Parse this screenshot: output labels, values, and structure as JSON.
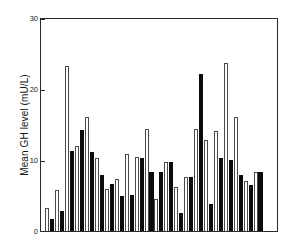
{
  "chart_data": {
    "type": "bar",
    "title": "",
    "xlabel": "",
    "ylabel": "Mean GH level (mU/L)",
    "ylim": [
      0,
      30
    ],
    "yticks": [
      0,
      10,
      20,
      30
    ],
    "ytick_labels": [
      "0",
      "10",
      "20",
      "30"
    ],
    "grid": false,
    "legend": "none",
    "xaxis_ticks_visible": false,
    "xtick_labels": [],
    "categories": [
      "1",
      "2",
      "3",
      "4",
      "5",
      "6",
      "7",
      "8",
      "9",
      "10",
      "11",
      "12",
      "13",
      "14",
      "15",
      "16",
      "17",
      "18",
      "19",
      "20",
      "21",
      "22",
      "23",
      "24",
      "25",
      "26"
    ],
    "series": [
      {
        "name": "open",
        "style": "white-filled-outlined",
        "color": "#ffffff",
        "edge_color": "#4a4a4a",
        "values": [
          3.3,
          5.8,
          23.3,
          12.0,
          16.2,
          10.4,
          6.0,
          7.4,
          10.9,
          10.5,
          14.1,
          4.6,
          8.3,
          9.8,
          6.2,
          7.7,
          14.4,
          12.9,
          14.1,
          23.8,
          16.1,
          7.1,
          8.3,
          0,
          0,
          0
        ]
      },
      {
        "name": "filled",
        "style": "black-filled",
        "color": "#0b0b0b",
        "edge_color": "#0b0b0b",
        "values": [
          1.7,
          2.9,
          11.3,
          14.3,
          11.2,
          7.9,
          6.6,
          4.9,
          5.1,
          10.4,
          8.4,
          8.3,
          9.8,
          2.5,
          7.6,
          22.2,
          3.8,
          10.4,
          10.0,
          7.9,
          6.5,
          8.3,
          0,
          0,
          0,
          0
        ]
      }
    ],
    "bars_in_draw_order": [
      {
        "fill": "white",
        "value": 3.3
      },
      {
        "fill": "black",
        "value": 1.7
      },
      {
        "fill": "white",
        "value": 5.8
      },
      {
        "fill": "black",
        "value": 2.9
      },
      {
        "fill": "white",
        "value": 23.3
      },
      {
        "fill": "black",
        "value": 11.3
      },
      {
        "fill": "white",
        "value": 12.0
      },
      {
        "fill": "black",
        "value": 14.3
      },
      {
        "fill": "white",
        "value": 16.2
      },
      {
        "fill": "black",
        "value": 11.2
      },
      {
        "fill": "white",
        "value": 10.4
      },
      {
        "fill": "black",
        "value": 7.9
      },
      {
        "fill": "white",
        "value": 6.0
      },
      {
        "fill": "black",
        "value": 6.6
      },
      {
        "fill": "white",
        "value": 7.4
      },
      {
        "fill": "black",
        "value": 4.9
      },
      {
        "fill": "white",
        "value": 10.9
      },
      {
        "fill": "black",
        "value": 5.1
      },
      {
        "fill": "white",
        "value": 10.5
      },
      {
        "fill": "black",
        "value": 10.4
      },
      {
        "fill": "white",
        "value": 14.4
      },
      {
        "fill": "black",
        "value": 8.4
      },
      {
        "fill": "white",
        "value": 4.6
      },
      {
        "fill": "black",
        "value": 8.3
      },
      {
        "fill": "white",
        "value": 9.8
      },
      {
        "fill": "black",
        "value": 9.8
      },
      {
        "fill": "white",
        "value": 6.2
      },
      {
        "fill": "black",
        "value": 2.5
      },
      {
        "fill": "white",
        "value": 7.7
      },
      {
        "fill": "black",
        "value": 7.6
      },
      {
        "fill": "white",
        "value": 14.4
      },
      {
        "fill": "black",
        "value": 22.2
      },
      {
        "fill": "white",
        "value": 12.9
      },
      {
        "fill": "black",
        "value": 3.8
      },
      {
        "fill": "white",
        "value": 14.1
      },
      {
        "fill": "black",
        "value": 10.4
      },
      {
        "fill": "white",
        "value": 23.8
      },
      {
        "fill": "black",
        "value": 10.0
      },
      {
        "fill": "white",
        "value": 16.1
      },
      {
        "fill": "black",
        "value": 7.9
      },
      {
        "fill": "white",
        "value": 7.1
      },
      {
        "fill": "black",
        "value": 6.5
      },
      {
        "fill": "white",
        "value": 8.3
      },
      {
        "fill": "black",
        "value": 8.3
      }
    ]
  },
  "axis": {
    "y_title": "Mean GH level (mU/L)",
    "tick_30": "30",
    "tick_20": "20",
    "tick_10": "10",
    "tick_0": "0"
  },
  "colors": {
    "frame": "#2a2a2a",
    "bar_black": "#0b0b0b",
    "bar_white": "#ffffff",
    "bar_outline": "#4a4a4a",
    "text": "#161616",
    "background": "#ffffff"
  }
}
